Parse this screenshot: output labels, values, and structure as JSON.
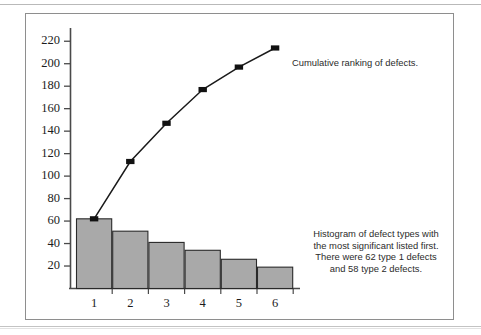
{
  "figure": {
    "border_color": "#8e8e8e",
    "background": "#ffffff"
  },
  "annotations": {
    "top_note": "Cumulative ranking of defects.",
    "bottom_note_lines": [
      "Histogram of defect types with",
      "the most significant listed first.",
      "There were 62 type 1 defects",
      "and 58 type 2 defects."
    ]
  },
  "chart_data": {
    "type": "bar",
    "title": "",
    "xlabel": "",
    "ylabel": "",
    "categories": [
      "1",
      "2",
      "3",
      "4",
      "5",
      "6"
    ],
    "ylim": [
      0,
      230
    ],
    "yticks": [
      20,
      40,
      60,
      80,
      100,
      120,
      140,
      160,
      180,
      200,
      220
    ],
    "grid": false,
    "legend": "none",
    "series": [
      {
        "name": "Defect count",
        "kind": "bar",
        "values": [
          62,
          51,
          41,
          34,
          26,
          19
        ],
        "fill": "#a9a9a9",
        "edge": "#2a2a2a"
      },
      {
        "name": "Cumulative ranking of defects",
        "kind": "line",
        "values": [
          62,
          113,
          147,
          177,
          197,
          214
        ],
        "line_color": "#1a1a1a",
        "marker": "square",
        "marker_color": "#111111"
      }
    ]
  }
}
